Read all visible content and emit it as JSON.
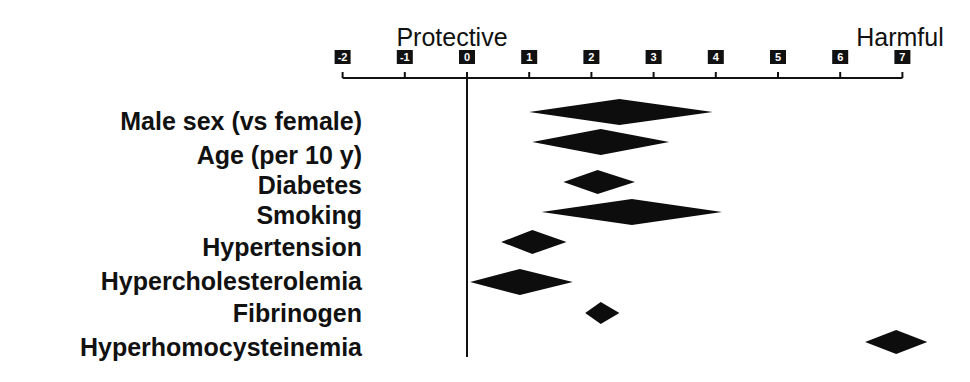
{
  "chart_data": {
    "type": "forest",
    "title": "",
    "header_labels": {
      "left": "Protective",
      "right": "Harmful"
    },
    "xlabel": "",
    "ylabel": "",
    "xlim": [
      -2,
      7
    ],
    "x_ticks": [
      -2,
      -1,
      0,
      1,
      2,
      3,
      4,
      5,
      6,
      7
    ],
    "x_tick_labels": [
      "-2",
      "-1",
      "0",
      "1",
      "2",
      "3",
      "4",
      "5",
      "6",
      "7"
    ],
    "reference_line": 0,
    "grid": false,
    "legend": null,
    "marker": "diamond",
    "categories": [
      "Male sex (vs female)",
      "Age (per 10 y)",
      "Diabetes",
      "Smoking",
      "Hypertension",
      "Hypercholesterolemia",
      "Fibrinogen",
      "Hyperhomocysteinemia"
    ],
    "series": [
      {
        "name": "Estimate",
        "points": [
          {
            "label": "Male sex (vs female)",
            "lower": 1.0,
            "estimate": 2.45,
            "upper": 3.95
          },
          {
            "label": "Age (per 10 y)",
            "lower": 1.05,
            "estimate": 2.15,
            "upper": 3.25
          },
          {
            "label": "Diabetes",
            "lower": 1.55,
            "estimate": 2.1,
            "upper": 2.7
          },
          {
            "label": "Smoking",
            "lower": 1.2,
            "estimate": 2.65,
            "upper": 4.1
          },
          {
            "label": "Hypertension",
            "lower": 0.55,
            "estimate": 1.05,
            "upper": 1.6
          },
          {
            "label": "Hypercholesterolemia",
            "lower": 0.05,
            "estimate": 0.85,
            "upper": 1.7
          },
          {
            "label": "Fibrinogen",
            "lower": 1.9,
            "estimate": 2.15,
            "upper": 2.45
          },
          {
            "label": "Hyperhomocysteinemia",
            "lower": 6.4,
            "estimate": 6.9,
            "upper": 7.4
          }
        ]
      }
    ]
  }
}
